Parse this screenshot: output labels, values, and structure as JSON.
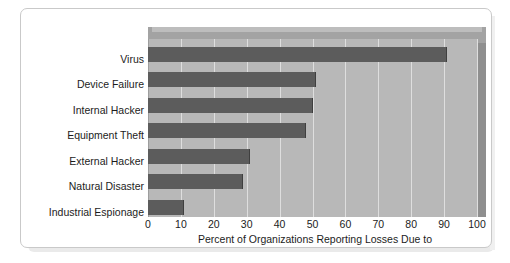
{
  "chart_data": {
    "type": "bar",
    "orientation": "horizontal",
    "title": "",
    "xlabel": "Percent of Organizations Reporting Losses Due to",
    "ylabel": "",
    "categories": [
      "Virus",
      "Device Failure",
      "Internal Hacker",
      "Equipment Theft",
      "External Hacker",
      "Natural Disaster",
      "Industrial Espionage"
    ],
    "values": [
      91,
      51,
      50,
      48,
      31,
      29,
      11
    ],
    "xlim": [
      0,
      100
    ],
    "xticks": [
      0,
      10,
      20,
      30,
      40,
      50,
      60,
      70,
      80,
      90,
      100
    ],
    "xtick_labels": [
      "0",
      "10",
      "20",
      "30",
      "40",
      "50",
      "60",
      "70",
      "80",
      "90",
      "100"
    ],
    "grid": "vertical",
    "legend": "none",
    "style": "3d-block",
    "colors": {
      "bar": "#5c5c5c",
      "bar_edge": "#3f3f3f",
      "plot_background": "#b8b8b8",
      "plot_top_face": "#a3a3a3",
      "plot_side_face": "#8f8f8f",
      "gridline": "#dedede",
      "axis_line": "#9d9d9d",
      "frame_border": "#c9c9c9",
      "page_background": "#ffffff",
      "text": "#1c1c1c"
    }
  }
}
